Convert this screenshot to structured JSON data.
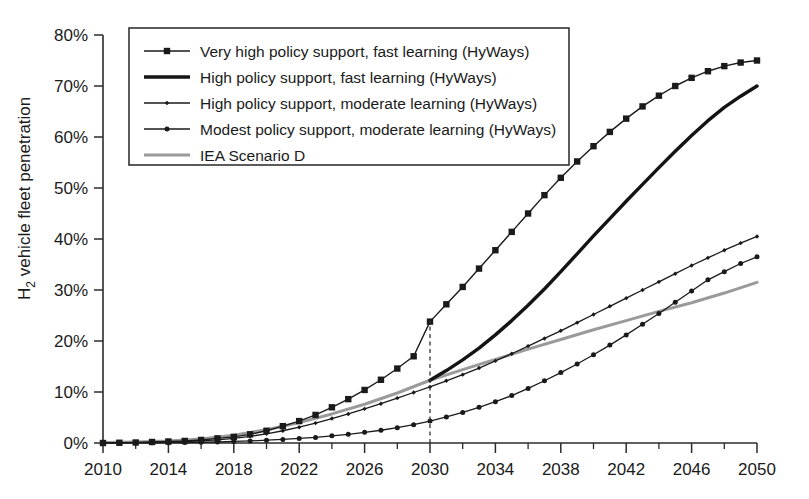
{
  "chart_data": {
    "type": "line",
    "title": "",
    "xlabel": "",
    "ylabel": "H2 vehicle fleet penetration",
    "ylabel_parts": {
      "main_a": "H",
      "sub": "2",
      "main_b": " vehicle fleet penetration"
    },
    "xlim": [
      2010,
      2050
    ],
    "ylim": [
      0,
      80
    ],
    "y_unit": "%",
    "grid": false,
    "legend_position": "top-left inside plot",
    "x_ticks": [
      2010,
      2014,
      2018,
      2022,
      2026,
      2030,
      2034,
      2038,
      2042,
      2046,
      2050
    ],
    "x_tick_labels": [
      "2010",
      "2014",
      "2018",
      "2022",
      "2026",
      "2030",
      "2034",
      "2038",
      "2042",
      "2046",
      "2050"
    ],
    "x_minor_tick_step": 2,
    "y_ticks": [
      0,
      10,
      20,
      30,
      40,
      50,
      60,
      70,
      80
    ],
    "y_tick_labels": [
      "0%",
      "10%",
      "20%",
      "30%",
      "40%",
      "50%",
      "60%",
      "70%",
      "80%"
    ],
    "annotations": [
      {
        "name": "year-2030-guide",
        "type": "vertical-dashed-line",
        "x": 2030,
        "y_from": 0,
        "y_to": 24
      }
    ],
    "series": [
      {
        "name": "Very high policy support, fast learning (HyWays)",
        "legend_label": "Very high policy support, fast learning (HyWays)",
        "marker": "square",
        "color": "#1a1a1a",
        "line_width": 1.4,
        "marker_size": 6.4,
        "x": [
          2010,
          2011,
          2012,
          2013,
          2014,
          2015,
          2016,
          2017,
          2018,
          2019,
          2020,
          2021,
          2022,
          2023,
          2024,
          2025,
          2026,
          2027,
          2028,
          2029,
          2030,
          2031,
          2032,
          2033,
          2034,
          2035,
          2036,
          2037,
          2038,
          2039,
          2040,
          2041,
          2042,
          2043,
          2044,
          2045,
          2046,
          2047,
          2048,
          2049,
          2050
        ],
        "values": [
          0.0,
          0.05,
          0.1,
          0.2,
          0.3,
          0.4,
          0.6,
          0.9,
          1.2,
          1.7,
          2.4,
          3.3,
          4.3,
          5.5,
          7.0,
          8.6,
          10.4,
          12.4,
          14.6,
          17.0,
          23.8,
          27.2,
          30.6,
          34.2,
          37.8,
          41.4,
          45.0,
          48.6,
          52.0,
          55.2,
          58.2,
          61.0,
          63.6,
          66.0,
          68.1,
          70.0,
          71.6,
          72.9,
          73.9,
          74.6,
          75.0
        ]
      },
      {
        "name": "High policy support, fast learning (HyWays)",
        "legend_label": "High policy support, fast learning (HyWays)",
        "marker": "none",
        "color": "#141414",
        "line_width": 3.4,
        "x": [
          2030,
          2031,
          2032,
          2033,
          2034,
          2035,
          2036,
          2037,
          2038,
          2039,
          2040,
          2041,
          2042,
          2043,
          2044,
          2045,
          2046,
          2047,
          2048,
          2049,
          2050
        ],
        "values": [
          12.3,
          14.2,
          16.3,
          18.6,
          21.2,
          24.0,
          27.0,
          30.2,
          33.6,
          37.1,
          40.6,
          44.0,
          47.4,
          50.7,
          54.0,
          57.2,
          60.3,
          63.2,
          65.8,
          68.0,
          70.0
        ]
      },
      {
        "name": "High policy support, moderate learning (HyWays)",
        "legend_label": "High policy support, moderate learning (HyWays)",
        "marker": "diamond-small",
        "color": "#1a1a1a",
        "line_width": 1.3,
        "marker_size": 4.4,
        "x": [
          2010,
          2011,
          2012,
          2013,
          2014,
          2015,
          2016,
          2017,
          2018,
          2019,
          2020,
          2021,
          2022,
          2023,
          2024,
          2025,
          2026,
          2027,
          2028,
          2029,
          2030,
          2031,
          2032,
          2033,
          2034,
          2035,
          2036,
          2037,
          2038,
          2039,
          2040,
          2041,
          2042,
          2043,
          2044,
          2045,
          2046,
          2047,
          2048,
          2049,
          2050
        ],
        "values": [
          0.0,
          0.03,
          0.06,
          0.1,
          0.15,
          0.25,
          0.4,
          0.6,
          0.9,
          1.3,
          1.8,
          2.4,
          3.1,
          3.9,
          4.8,
          5.7,
          6.7,
          7.7,
          8.8,
          9.9,
          11.0,
          12.2,
          13.4,
          14.7,
          16.1,
          17.5,
          19.0,
          20.5,
          22.0,
          23.6,
          25.2,
          26.8,
          28.4,
          30.0,
          31.6,
          33.2,
          34.8,
          36.3,
          37.8,
          39.2,
          40.5
        ]
      },
      {
        "name": "Modest policy support, moderate learning (HyWays)",
        "legend_label": "Modest policy support, moderate learning (HyWays)",
        "marker": "circle",
        "color": "#1a1a1a",
        "line_width": 1.3,
        "marker_size": 5.0,
        "x": [
          2010,
          2011,
          2012,
          2013,
          2014,
          2015,
          2016,
          2017,
          2018,
          2019,
          2020,
          2021,
          2022,
          2023,
          2024,
          2025,
          2026,
          2027,
          2028,
          2029,
          2030,
          2031,
          2032,
          2033,
          2034,
          2035,
          2036,
          2037,
          2038,
          2039,
          2040,
          2041,
          2042,
          2043,
          2044,
          2045,
          2046,
          2047,
          2048,
          2049,
          2050
        ],
        "values": [
          0.0,
          0.0,
          0.02,
          0.04,
          0.07,
          0.1,
          0.15,
          0.2,
          0.3,
          0.4,
          0.55,
          0.7,
          0.9,
          1.1,
          1.4,
          1.7,
          2.1,
          2.5,
          3.0,
          3.6,
          4.3,
          5.1,
          6.0,
          7.0,
          8.1,
          9.3,
          10.7,
          12.2,
          13.8,
          15.5,
          17.3,
          19.2,
          21.2,
          23.3,
          25.4,
          27.6,
          29.8,
          32.0,
          33.6,
          35.2,
          36.5
        ]
      },
      {
        "name": "IEA Scenario D",
        "legend_label": "IEA Scenario D",
        "marker": "none",
        "color": "#9a9a9a",
        "line_width": 3.0,
        "x": [
          2010,
          2012,
          2014,
          2016,
          2018,
          2020,
          2022,
          2024,
          2026,
          2028,
          2030,
          2032,
          2034,
          2036,
          2038,
          2040,
          2042,
          2044,
          2046,
          2048,
          2050
        ],
        "values": [
          0.1,
          0.2,
          0.4,
          0.8,
          1.5,
          2.6,
          4.0,
          5.7,
          7.6,
          9.8,
          12.3,
          14.4,
          16.4,
          18.4,
          20.3,
          22.2,
          24.0,
          25.8,
          27.5,
          29.4,
          31.5
        ]
      }
    ]
  },
  "legend": {
    "items": [
      {
        "label": "Very high policy support, fast learning (HyWays)",
        "marker": "square",
        "color": "#1a1a1a"
      },
      {
        "label": "High policy support, fast learning (HyWays)",
        "marker": "none",
        "color": "#141414"
      },
      {
        "label": "High policy support, moderate learning (HyWays)",
        "marker": "diamond-small",
        "color": "#1a1a1a"
      },
      {
        "label": "Modest policy support, moderate learning (HyWays)",
        "marker": "circle",
        "color": "#1a1a1a"
      },
      {
        "label": "IEA Scenario D",
        "marker": "none",
        "color": "#9a9a9a"
      }
    ]
  }
}
